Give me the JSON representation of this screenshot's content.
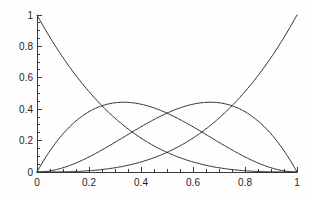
{
  "chart_data": {
    "type": "line",
    "title": "",
    "subtitle": "",
    "xlabel": "",
    "ylabel": "",
    "xlim": [
      0,
      1
    ],
    "ylim": [
      0,
      1
    ],
    "grid": false,
    "legend": "none",
    "background_color": "#fefefe",
    "curve_color": "#2e2e2e",
    "axis_color": "#3a3a3a",
    "x_ticks": [
      "0",
      "0.2",
      "0.4",
      "0.6",
      "0.8",
      "1"
    ],
    "x_tick_values": [
      0,
      0.2,
      0.4,
      0.6,
      0.8,
      1
    ],
    "y_ticks": [
      "0",
      "0.2",
      "0.4",
      "0.6",
      "0.8",
      "1"
    ],
    "y_tick_values": [
      0,
      0.2,
      0.4,
      0.6,
      0.8,
      1
    ],
    "minor_tick_step": 0.05,
    "x": [
      0,
      0.05,
      0.1,
      0.15,
      0.2,
      0.25,
      0.3,
      0.35,
      0.4,
      0.45,
      0.5,
      0.55,
      0.6,
      0.65,
      0.7,
      0.75,
      0.8,
      0.85,
      0.9,
      0.95,
      1
    ],
    "series": [
      {
        "name": "B0",
        "values": [
          1,
          0.857375,
          0.729,
          0.614125,
          0.512,
          0.421875,
          0.343,
          0.274625,
          0.216,
          0.166375,
          0.125,
          0.091125,
          0.064,
          0.042875,
          0.027,
          0.015625,
          0.008,
          0.003375,
          0.001,
          0.000125,
          0
        ]
      },
      {
        "name": "B1",
        "values": [
          0,
          0.135375,
          0.243,
          0.325125,
          0.384,
          0.421875,
          0.441,
          0.444375,
          0.432,
          0.408375,
          0.375,
          0.334125,
          0.288,
          0.239625,
          0.189,
          0.140625,
          0.096,
          0.057375,
          0.027,
          0.007125,
          0
        ]
      },
      {
        "name": "B2",
        "values": [
          0,
          0.007125,
          0.027,
          0.057375,
          0.096,
          0.140625,
          0.189,
          0.239625,
          0.288,
          0.334125,
          0.375,
          0.408375,
          0.432,
          0.444375,
          0.441,
          0.421875,
          0.384,
          0.325125,
          0.243,
          0.135375,
          0
        ]
      },
      {
        "name": "B3",
        "values": [
          0,
          0.000125,
          0.001,
          0.003375,
          0.008,
          0.015625,
          0.027,
          0.042875,
          0.064,
          0.091125,
          0.125,
          0.166375,
          0.216,
          0.274625,
          0.343,
          0.421875,
          0.512,
          0.614125,
          0.729,
          0.857375,
          1
        ]
      }
    ],
    "annotations": []
  },
  "plot_geometry": {
    "origin_x_px": 37,
    "origin_y_px": 172,
    "right_x_px": 297,
    "top_y_px": 15,
    "major_tick_len": 5,
    "minor_tick_len": 3
  }
}
